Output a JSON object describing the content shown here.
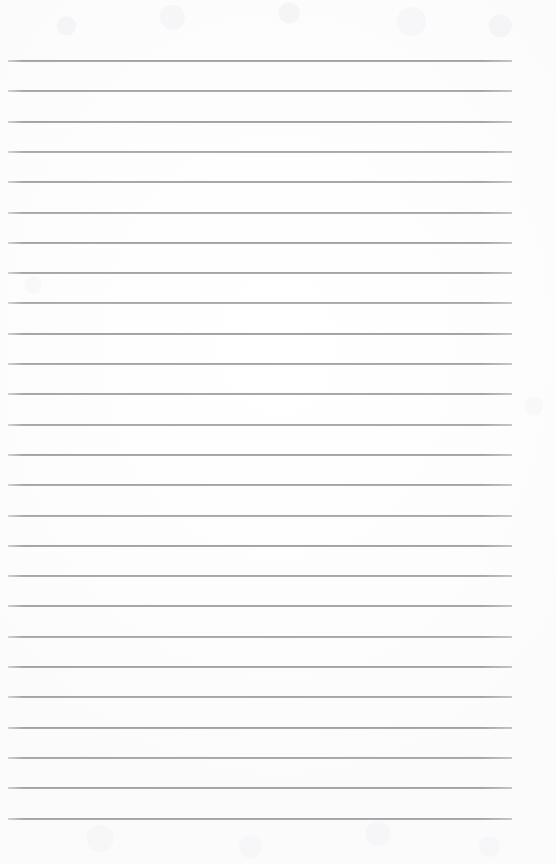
{
  "document": {
    "kind": "scanned-ruled-notebook-page",
    "title": "",
    "page_text": "",
    "is_blank": true,
    "visible_text_content": []
  },
  "page": {
    "width_px": 556,
    "height_px": 864,
    "background_color": "#fdfdfd",
    "paper_color": "#ffffff"
  },
  "ruling": {
    "line_color": "#82828a",
    "line_thickness_px": 2,
    "line_count": 26,
    "line_left_px": 8,
    "line_right_px": 512,
    "line_width_px": 504,
    "first_line_y_px": 60,
    "line_spacing_px": 30.3,
    "last_line_y_px": 817.5,
    "line_y_positions": [
      60,
      90.3,
      120.6,
      150.9,
      181.2,
      211.5,
      241.8,
      272.1,
      302.4,
      332.7,
      363,
      393.3,
      423.6,
      453.9,
      484.2,
      514.5,
      544.8,
      575.1,
      605.4,
      635.7,
      666,
      696.3,
      726.6,
      756.9,
      787.2,
      817.5
    ],
    "line_opacities": [
      0.95,
      0.92,
      0.96,
      0.9,
      0.94,
      0.91,
      0.95,
      0.93,
      0.9,
      0.96,
      0.92,
      0.94,
      0.91,
      0.95,
      0.93,
      0.9,
      0.96,
      0.92,
      0.95,
      0.91,
      0.94,
      0.93,
      0.96,
      0.92,
      0.95,
      0.93
    ]
  },
  "margins": {
    "top_blank_px": 60,
    "bottom_blank_px": 46,
    "left_px": 8,
    "right_px": 44
  }
}
